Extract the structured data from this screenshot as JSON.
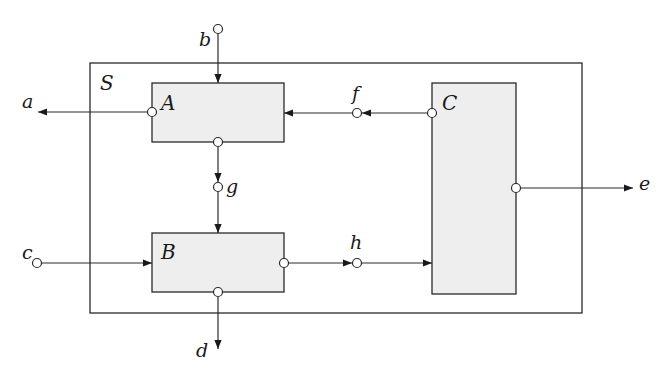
{
  "diagram": {
    "type": "block-diagram",
    "system": {
      "label": "S"
    },
    "blocks": [
      {
        "id": "A",
        "label": "A"
      },
      {
        "id": "B",
        "label": "B"
      },
      {
        "id": "C",
        "label": "C"
      }
    ],
    "signals": [
      {
        "id": "a",
        "label": "a",
        "role": "external output",
        "from": "A",
        "to": "outside"
      },
      {
        "id": "b",
        "label": "b",
        "role": "external input",
        "from": "outside",
        "to": "A"
      },
      {
        "id": "c",
        "label": "c",
        "role": "external input",
        "from": "outside",
        "to": "B"
      },
      {
        "id": "d",
        "label": "d",
        "role": "external output",
        "from": "B",
        "to": "outside"
      },
      {
        "id": "e",
        "label": "e",
        "role": "external output",
        "from": "C",
        "to": "outside"
      },
      {
        "id": "f",
        "label": "f",
        "role": "internal",
        "from": "C",
        "to": "A"
      },
      {
        "id": "g",
        "label": "g",
        "role": "internal",
        "from": "A",
        "to": "B"
      },
      {
        "id": "h",
        "label": "h",
        "role": "internal",
        "from": "B",
        "to": "C"
      }
    ],
    "colors": {
      "stroke": "#2a2a2a",
      "block_fill": "#eeeeee",
      "system_fill": "#ffffff"
    }
  }
}
